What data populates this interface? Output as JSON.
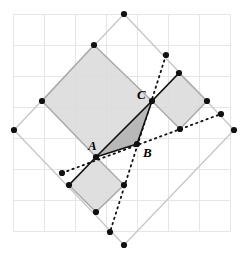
{
  "figure": {
    "name": "geometric-square-triangle-construction",
    "width": 249,
    "height": 260,
    "background": "#ffffff"
  },
  "grid": {
    "name": "background-grid",
    "color": "#e6e6e6",
    "stroke_width": 1,
    "cell_size": 31,
    "x_start": 13,
    "y_start": 14,
    "columns": 7,
    "rows": 7,
    "x_lines": [
      13,
      44,
      75,
      106,
      137,
      168,
      199,
      230
    ],
    "y_lines": [
      14,
      45,
      76,
      107,
      138,
      169,
      200,
      231
    ]
  },
  "colors": {
    "grid": "#e6e6e6",
    "outer_square_stroke": "#c8c8c8",
    "big_square_fill": "#d9d9d9",
    "big_square_stroke": "#a8a8a8",
    "small_square_fill": "#dcdcdc",
    "small_square_stroke": "#a8a8a8",
    "triangle_fill": "#b4b4b4",
    "triangle_stroke": "#111111",
    "dotted_stroke": "#111111",
    "vertex_dot": "#111111",
    "label_text": "#000000"
  },
  "labels": [
    {
      "id": "A",
      "text": "A",
      "x": 88,
      "y": 150
    },
    {
      "id": "B",
      "text": "B",
      "x": 143,
      "y": 157
    },
    {
      "id": "C",
      "text": "C",
      "x": 137,
      "y": 99
    }
  ],
  "triangle": {
    "name": "triangle-ABC",
    "vertices": [
      {
        "label": "A",
        "x": 96,
        "y": 157
      },
      {
        "label": "B",
        "x": 137,
        "y": 144
      },
      {
        "label": "C",
        "x": 152,
        "y": 101
      }
    ],
    "points_attr": "96,157 137,144 152,101"
  },
  "outer_square": {
    "name": "outer-light-square",
    "points_attr": "124,14 234,130 124,245 14,130"
  },
  "big_square": {
    "name": "large-gray-square",
    "points_attr": "94,45 152,101 96,157 42,101"
  },
  "small_square_right": {
    "name": "small-square-on-BC",
    "points_attr": "152,101 179,73 207,101 180,129"
  },
  "small_square_left": {
    "name": "small-square-on-AB",
    "points_attr": "96,157 69,185 96,212 124,185"
  },
  "solid_segments": [
    {
      "name": "segment-A-to-small-square-corner",
      "x1": 96,
      "y1": 157,
      "x2": 69,
      "y2": 185
    },
    {
      "name": "segment-C-to-small-square-corner",
      "x1": 152,
      "y1": 101,
      "x2": 179,
      "y2": 73
    }
  ],
  "dotted_segments": [
    {
      "name": "dotted-cevian-C-to-bottom",
      "x1": 166,
      "y1": 55,
      "x2": 110,
      "y2": 232
    },
    {
      "name": "dotted-line-through-B-right",
      "x1": 62,
      "y1": 173,
      "x2": 221,
      "y2": 114
    }
  ],
  "vertex_dots": [
    {
      "name": "dot-outer-top",
      "x": 124,
      "y": 14
    },
    {
      "name": "dot-outer-left",
      "x": 14,
      "y": 130
    },
    {
      "name": "dot-outer-right",
      "x": 234,
      "y": 130
    },
    {
      "name": "dot-outer-bottom",
      "x": 124,
      "y": 245
    },
    {
      "name": "dot-big-square-top",
      "x": 94,
      "y": 45
    },
    {
      "name": "dot-big-square-left",
      "x": 42,
      "y": 101
    },
    {
      "name": "dot-vertex-A",
      "x": 96,
      "y": 157
    },
    {
      "name": "dot-vertex-B",
      "x": 137,
      "y": 144
    },
    {
      "name": "dot-vertex-C",
      "x": 152,
      "y": 101
    },
    {
      "name": "dot-right-square-top",
      "x": 179,
      "y": 73
    },
    {
      "name": "dot-right-square-right",
      "x": 207,
      "y": 101
    },
    {
      "name": "dot-right-square-bottom",
      "x": 180,
      "y": 129
    },
    {
      "name": "dot-left-square-left",
      "x": 69,
      "y": 185
    },
    {
      "name": "dot-left-square-bottom",
      "x": 96,
      "y": 212
    },
    {
      "name": "dot-left-square-right",
      "x": 124,
      "y": 185
    },
    {
      "name": "dot-dotted-end-upper",
      "x": 166,
      "y": 55
    },
    {
      "name": "dot-dotted-end-lower",
      "x": 110,
      "y": 232
    },
    {
      "name": "dot-dotted-end-left",
      "x": 62,
      "y": 173
    },
    {
      "name": "dot-dotted-end-right",
      "x": 221,
      "y": 114
    }
  ]
}
